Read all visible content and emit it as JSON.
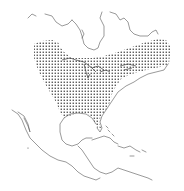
{
  "map": {
    "type": "species-range-map",
    "region": "North America and Central America",
    "range_fill": "stippled",
    "colors": {
      "background": "#ffffff",
      "coastline": "#555555",
      "stipple": "#333333"
    },
    "range_description": "Eastern North America: Great Lakes region, northeastern US/southeastern Canada, south through the eastern United States to the Gulf Coast and Florida"
  }
}
